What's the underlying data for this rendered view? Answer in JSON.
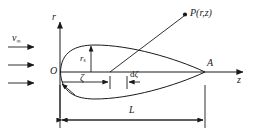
{
  "figure": {
    "type": "axisymmetric-body-source-distribution-diagram",
    "axes": {
      "vertical_label": "r",
      "horizontal_label": "z",
      "origin_label": "O"
    },
    "labels": {
      "freestream": "v",
      "freestream_sub": "∞",
      "point": "P(r,z)",
      "nose_tail": "A",
      "length": "L",
      "coordinate": "ζ",
      "element": "dζ",
      "element_prefix": "d",
      "radius": "r",
      "radius_sub": "s"
    },
    "colors": {
      "stroke": "#1a1a1a",
      "background": "#ffffff"
    },
    "geometry": {
      "origin_px": [
        60,
        72
      ],
      "tail_px": [
        205,
        72
      ],
      "length_px": 145,
      "max_radius_px": 27,
      "point_P_px": [
        186,
        14
      ],
      "zeta_tick_px": 110,
      "dzeta_end_px": 127,
      "stream_arrows": 3
    }
  }
}
